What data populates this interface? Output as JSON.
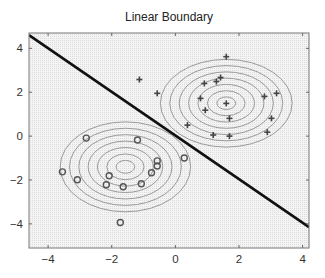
{
  "chart_data": {
    "type": "scatter",
    "title": "Linear Boundary",
    "xlabel": "",
    "ylabel": "",
    "xlim": [
      -4.6,
      4.2
    ],
    "ylim": [
      -5.1,
      4.7
    ],
    "xticks": [
      -4,
      -2,
      0,
      2,
      4
    ],
    "yticks": [
      -4,
      -2,
      0,
      2,
      4
    ],
    "xtick_labels": [
      "−4",
      "−2",
      "0",
      "2",
      "4"
    ],
    "ytick_labels": [
      "−4",
      "−2",
      "0",
      "2",
      "4"
    ],
    "grid": true,
    "legend": null,
    "series": [
      {
        "name": "class-plus",
        "marker": "+",
        "color": "#444444",
        "points": [
          [
            1.6,
            3.62
          ],
          [
            1.42,
            2.67
          ],
          [
            1.29,
            2.49
          ],
          [
            0.91,
            2.4
          ],
          [
            -0.57,
            1.95
          ],
          [
            2.8,
            1.81
          ],
          [
            3.18,
            1.95
          ],
          [
            0.79,
            1.72
          ],
          [
            1.6,
            1.49
          ],
          [
            0.94,
            1.18
          ],
          [
            1.7,
            0.81
          ],
          [
            3.02,
            0.81
          ],
          [
            0.38,
            0.5
          ],
          [
            2.89,
            0.18
          ],
          [
            1.19,
            0.05
          ],
          [
            1.7,
            0.0
          ],
          [
            -1.13,
            2.58
          ]
        ]
      },
      {
        "name": "class-circle",
        "marker": "o",
        "color": "#555555",
        "points": [
          [
            -2.8,
            -0.09
          ],
          [
            -1.19,
            -0.18
          ],
          [
            -3.55,
            -1.63
          ],
          [
            -3.08,
            -1.99
          ],
          [
            -2.08,
            -1.81
          ],
          [
            -2.17,
            -2.22
          ],
          [
            -1.64,
            -2.31
          ],
          [
            -1.07,
            -2.17
          ],
          [
            -0.75,
            -1.67
          ],
          [
            -0.57,
            -1.13
          ],
          [
            -0.57,
            -1.36
          ],
          [
            0.28,
            -1.0
          ],
          [
            -1.73,
            -3.94
          ]
        ]
      }
    ],
    "decision_boundary": {
      "type": "line",
      "points": [
        [
          -4.6,
          4.6
        ],
        [
          4.2,
          -4.15
        ]
      ],
      "color": "#111111"
    },
    "contours": [
      {
        "center": [
          1.6,
          1.5
        ],
        "rx_outer": 2.07,
        "ry_outer": 2.0,
        "levels": 7,
        "color": "#999999"
      },
      {
        "center": [
          -1.57,
          -1.4
        ],
        "rx_outer": 2.05,
        "ry_outer": 2.05,
        "levels": 7,
        "color": "#999999"
      }
    ]
  }
}
